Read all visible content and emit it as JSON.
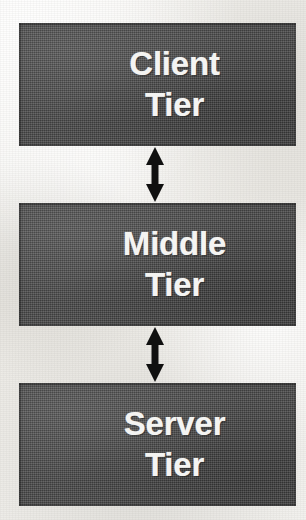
{
  "diagram": {
    "background_color": "#f2f1ee",
    "box_fill_color": "#4b4b4b",
    "label_color": "#f4f4f2",
    "arrow_color": "#101010",
    "tiers": [
      {
        "id": "client",
        "line_1": "Client",
        "line_2": "Tier"
      },
      {
        "id": "middle",
        "line_1": "Middle",
        "line_2": "Tier"
      },
      {
        "id": "server",
        "line_1": "Server",
        "line_2": "Tier"
      }
    ],
    "connectors": [
      {
        "id": "client-middle",
        "from": "Client Tier",
        "to": "Middle Tier",
        "style": "double-headed-arrow"
      },
      {
        "id": "middle-server",
        "from": "Middle Tier",
        "to": "Server Tier",
        "style": "double-headed-arrow"
      }
    ]
  }
}
